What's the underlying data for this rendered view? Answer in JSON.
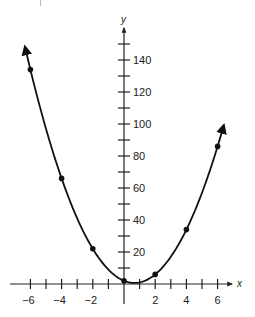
{
  "chart_data": {
    "type": "line",
    "title": "",
    "xlabel": "x",
    "ylabel": "y",
    "function": "y = 3x^2 - 4x + 2",
    "xlim": [
      -7,
      7
    ],
    "ylim": [
      0,
      150
    ],
    "grid": false,
    "legend": null,
    "x_ticks": [
      -6,
      -5,
      -4,
      -3,
      -2,
      -1,
      0,
      1,
      2,
      3,
      4,
      5,
      6
    ],
    "x_tick_labels": [
      "−6",
      "−4",
      "−2",
      "2",
      "4",
      "6"
    ],
    "x_tick_label_values": [
      -6,
      -4,
      -2,
      2,
      4,
      6
    ],
    "y_ticks": [
      10,
      20,
      30,
      40,
      50,
      60,
      70,
      80,
      90,
      100,
      110,
      120,
      130,
      140,
      150
    ],
    "y_tick_labels": [
      "20",
      "40",
      "60",
      "80",
      "100",
      "120",
      "140"
    ],
    "y_tick_label_values": [
      20,
      40,
      60,
      80,
      100,
      120,
      140
    ],
    "series": [
      {
        "name": "parabola",
        "x": [
          -6,
          -4,
          -2,
          0,
          2,
          4,
          6
        ],
        "values": [
          134,
          66,
          22,
          2,
          6,
          34,
          86
        ],
        "marker": "dot",
        "curve_extends_with_arrows": true
      }
    ],
    "vertex": {
      "x": 0.67,
      "y": 0.67
    }
  },
  "geometry": {
    "origin_px": [
      124,
      284
    ],
    "x_px_per_unit": 15.6,
    "y_px_per_unit": 1.6,
    "x_axis_px": [
      10,
      232
    ],
    "y_axis_top_px": 28,
    "y_axis_bottom_px": 304,
    "curve_x_range": [
      -6.35,
      6.4
    ]
  }
}
